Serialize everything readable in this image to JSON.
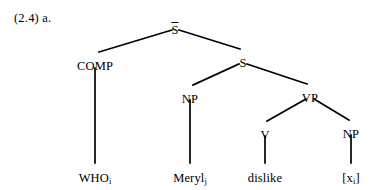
{
  "figure": {
    "example_number": "(2.4)",
    "subpart": "a.",
    "label": "(2.4) a.",
    "type": "syntax-tree",
    "background_color": "#ffffff",
    "line_color": "#000000",
    "text_color": "#000000"
  },
  "tree": {
    "root_label": "S",
    "root_has_overbar": true,
    "nodes": [
      {
        "id": "sbar",
        "label": "S",
        "overbar": true,
        "x": 175,
        "y": 22,
        "kind": "nonterminal"
      },
      {
        "id": "comp",
        "label": "COMP",
        "overbar": false,
        "x": 95,
        "y": 60,
        "kind": "nonterminal"
      },
      {
        "id": "s",
        "label": "S",
        "overbar": false,
        "x": 243,
        "y": 57,
        "kind": "nonterminal"
      },
      {
        "id": "np1",
        "label": "NP",
        "overbar": false,
        "x": 190,
        "y": 93,
        "kind": "nonterminal"
      },
      {
        "id": "vp",
        "label": "VP",
        "overbar": false,
        "x": 310,
        "y": 92,
        "kind": "nonterminal"
      },
      {
        "id": "v",
        "label": "V",
        "overbar": false,
        "x": 265,
        "y": 129,
        "kind": "nonterminal"
      },
      {
        "id": "np2",
        "label": "NP",
        "overbar": false,
        "x": 351,
        "y": 128,
        "kind": "nonterminal"
      }
    ],
    "terminals": [
      {
        "id": "who",
        "text": "WHO",
        "subscript": "i",
        "x": 95,
        "y": 172,
        "parent": "comp"
      },
      {
        "id": "meryl",
        "text": "Meryl",
        "subscript": "j",
        "x": 190,
        "y": 172,
        "parent": "np1"
      },
      {
        "id": "dislike",
        "text": "dislike",
        "subscript": "",
        "x": 265,
        "y": 172,
        "parent": "v"
      },
      {
        "id": "trace",
        "text": "[x",
        "subscript": "i",
        "suffix": "]",
        "x": 351,
        "y": 172,
        "parent": "np2"
      }
    ],
    "edges": [
      {
        "from": "sbar",
        "to": "comp",
        "x1": 172,
        "y1": 30,
        "x2": 99,
        "y2": 52
      },
      {
        "from": "sbar",
        "to": "s",
        "x1": 179,
        "y1": 30,
        "x2": 240,
        "y2": 49
      },
      {
        "from": "s",
        "to": "np1",
        "x1": 239,
        "y1": 64,
        "x2": 193,
        "y2": 85
      },
      {
        "from": "s",
        "to": "vp",
        "x1": 247,
        "y1": 64,
        "x2": 307,
        "y2": 84
      },
      {
        "from": "vp",
        "to": "v",
        "x1": 306,
        "y1": 99,
        "x2": 267,
        "y2": 121
      },
      {
        "from": "vp",
        "to": "np2",
        "x1": 314,
        "y1": 99,
        "x2": 349,
        "y2": 120
      },
      {
        "from": "comp",
        "to": "who",
        "x1": 95,
        "y1": 68,
        "x2": 95,
        "y2": 163
      },
      {
        "from": "np1",
        "to": "meryl",
        "x1": 190,
        "y1": 100,
        "x2": 190,
        "y2": 163
      },
      {
        "from": "v",
        "to": "dislike",
        "x1": 265,
        "y1": 136,
        "x2": 265,
        "y2": 163
      },
      {
        "from": "np2",
        "to": "trace",
        "x1": 351,
        "y1": 135,
        "x2": 351,
        "y2": 163
      }
    ]
  }
}
